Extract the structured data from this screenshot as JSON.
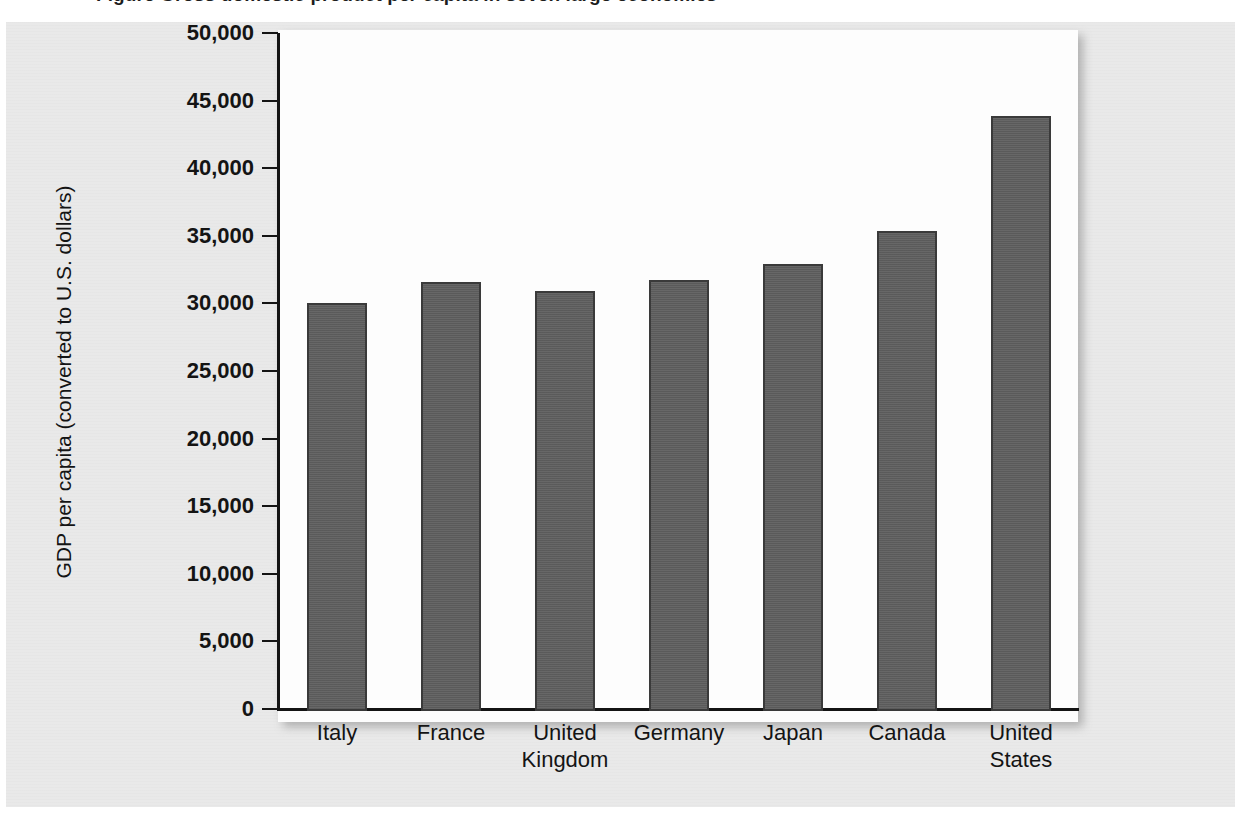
{
  "figure": {
    "caption_top": "Figure   Gross domestic product per capita in seven large economies",
    "background_color": "#e9e9e9",
    "plot_background_color": "#fdfdfd",
    "bar_color": "#5f5f5f",
    "axis_color": "#141414"
  },
  "chart_data": {
    "type": "bar",
    "title": "",
    "xlabel": "",
    "ylabel": "GDP per capita (converted to U.S. dollars)",
    "categories": [
      "Italy",
      "United Kingdom",
      "France",
      "Germany",
      "Japan",
      "Canada",
      "United States"
    ],
    "categories_display": [
      [
        "Italy"
      ],
      [
        "France"
      ],
      [
        "United",
        "Kingdom"
      ],
      [
        "Germany"
      ],
      [
        "Japan"
      ],
      [
        "Canada"
      ],
      [
        "United",
        "States"
      ]
    ],
    "category_order": [
      "Italy",
      "France",
      "United Kingdom",
      "Germany",
      "Japan",
      "Canada",
      "United States"
    ],
    "values": [
      30200,
      31100,
      31700,
      31900,
      33100,
      35500,
      44000
    ],
    "ylim": [
      0,
      50000
    ],
    "yticks": [
      0,
      5000,
      10000,
      15000,
      20000,
      25000,
      30000,
      35000,
      40000,
      45000,
      50000
    ],
    "ytick_labels": [
      "0",
      "5,000",
      "10,000",
      "15,000",
      "20,000",
      "25,000",
      "30,000",
      "35,000",
      "40,000",
      "45,000",
      "50,000"
    ],
    "grid": false,
    "legend": null,
    "legend_position": "none"
  }
}
